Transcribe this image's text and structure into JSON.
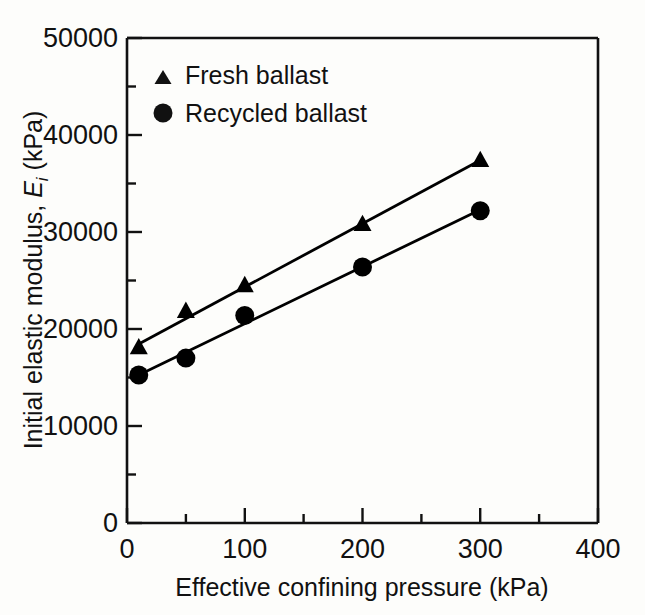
{
  "chart_data": {
    "type": "scatter",
    "title": "",
    "xlabel": "Effective confining pressure (kPa)",
    "ylabel_prefix": "Initial elastic modulus, ",
    "ylabel_symbol": "E",
    "ylabel_subscript": "i",
    "ylabel_units": " (kPa)",
    "ylabel_full": "Initial elastic modulus, Ei (kPa)",
    "xlim": [
      0,
      400
    ],
    "ylim": [
      0,
      50000
    ],
    "xticks": [
      0,
      100,
      200,
      300,
      400
    ],
    "xtick_labels": [
      "0",
      "100",
      "200",
      "300",
      "400"
    ],
    "xminor_step": 50,
    "yticks": [
      0,
      10000,
      20000,
      30000,
      40000,
      50000
    ],
    "ytick_labels": [
      "0",
      "10000",
      "20000",
      "30000",
      "40000",
      "50000"
    ],
    "yminor_step": 5000,
    "grid": false,
    "legend_position": "top-left-inside",
    "series": [
      {
        "name": "Fresh ballast",
        "marker": "triangle",
        "color": "#000000",
        "x": [
          10,
          50,
          100,
          200,
          300
        ],
        "values": [
          18100,
          21850,
          24500,
          30800,
          37400
        ],
        "fit_line": {
          "x": [
            10,
            300
          ],
          "y": [
            18450,
            37400
          ]
        }
      },
      {
        "name": "Recycled ballast",
        "marker": "circle",
        "color": "#000000",
        "x": [
          10,
          50,
          100,
          200,
          300
        ],
        "values": [
          15250,
          17000,
          21400,
          26400,
          32200
        ],
        "fit_line": {
          "x": [
            10,
            300
          ],
          "y": [
            15250,
            32300
          ]
        }
      }
    ]
  },
  "legend": {
    "items": [
      {
        "label": "Fresh ballast",
        "marker": "triangle"
      },
      {
        "label": "Recycled ballast",
        "marker": "circle"
      }
    ]
  },
  "colors": {
    "ink": "#000000",
    "page": "#fdfdfb"
  }
}
